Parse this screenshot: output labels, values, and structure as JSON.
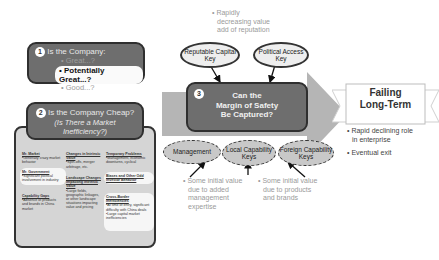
{
  "top_note": {
    "bullet": "•",
    "text_lines": [
      "Rapidly",
      "decreasing value",
      "add of reputation"
    ]
  },
  "box1": {
    "number": "1",
    "title": "Is the Company:",
    "options": [
      "Great...?",
      "Potentially Great...?",
      "Good...?"
    ],
    "selected_index": 1
  },
  "box2": {
    "number": "2",
    "title": "Is the Company Cheap?",
    "subtitle": "(Is There a Market Inefficiency?)",
    "columns": [
      [
        {
          "heading": "Mr. Market",
          "body": "•Generally crazy market behavior",
          "highlight": false
        },
        {
          "heading": "Mr. Government",
          "body": "•Significant political involvement in industry",
          "highlight": true
        },
        {
          "heading": "Capability Gaps",
          "body": "•Absence of products and brands in China market",
          "highlight": false
        }
      ],
      [
        {
          "heading": "Changes in Intrinsic Value",
          "body": "•Spin-offs, merger arbitrage, etc.",
          "highlight": false
        },
        {
          "heading": "Landscape Changes Impacting Intrinsic Value",
          "body": "•Large fields, geographic linkages, or other landscape situations impacting value and pricing",
          "highlight": false
        }
      ],
      [
        {
          "heading": "Temporary Problems",
          "body": "•Management, economic downturns, cyclical",
          "highlight": false
        },
        {
          "heading": "Biases and Other Odd Investor Behavior",
          "body": "",
          "highlight": true
        },
        {
          "heading": "Cross-Border Inefficiencies",
          "body": "•At time of entry, significant difficulty with China deals •Large capital market inefficiencies",
          "highlight": true
        }
      ]
    ]
  },
  "box3": {
    "number": "3",
    "title_lines": [
      "Can the",
      "Margin of Safety",
      "Be Captured?"
    ]
  },
  "top_keys": [
    {
      "label_lines": [
        "Reputable Capital",
        "Key"
      ]
    },
    {
      "label_lines": [
        "Political Access",
        "Key"
      ]
    }
  ],
  "bottom_keys": [
    {
      "label_lines": [
        "Management"
      ]
    },
    {
      "label_lines": [
        "Local Capability",
        "Keys"
      ]
    },
    {
      "label_lines": [
        "Foreign Capability",
        "Keys"
      ]
    }
  ],
  "bottom_notes": [
    {
      "bullet": "•",
      "text_lines": [
        "Some initial value",
        "due to added",
        "management",
        "expertise"
      ]
    },
    {
      "bullet": "•",
      "text_lines": [
        "Some initial value",
        "due to products",
        "and brands"
      ]
    }
  ],
  "result": {
    "banner_lines": [
      "Failing",
      "Long-Term"
    ],
    "bullets": [
      {
        "lines": [
          "Rapid declining role",
          "in enterprise"
        ]
      },
      {
        "lines": [
          "Eventual exit"
        ]
      }
    ]
  },
  "colors": {
    "dark_box": "#6e6e6e",
    "arrow_band": "#b5b5b5",
    "dashed_oval": "#c8c8c8",
    "note_text": "#9a9a9a"
  }
}
